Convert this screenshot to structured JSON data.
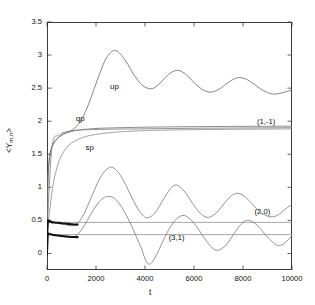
{
  "chart_data": {
    "type": "line",
    "title": "",
    "xlabel": "t",
    "ylabel": "<Y_m,n>",
    "ylabel_base": "<Y",
    "ylabel_sub": "m,n",
    "ylabel_close": ">",
    "xlim": [
      0,
      10000
    ],
    "ylim": [
      -0.25,
      3.5
    ],
    "grid": false,
    "legend": "none (inline curve annotations)",
    "xticks": [
      0,
      2000,
      4000,
      6000,
      8000,
      10000
    ],
    "xtick_labels": [
      "0",
      "2000",
      "4000",
      "6000",
      "8000",
      "10000"
    ],
    "yticks": [
      0,
      0.5,
      1,
      1.5,
      2,
      2.5,
      3,
      3.5
    ],
    "ytick_labels": [
      "0",
      "0.5",
      "1",
      "1.5",
      "2",
      "2.5",
      "3",
      "3.5"
    ],
    "annotations": [
      {
        "text": "up",
        "x": 2900,
        "y": 2.52,
        "name": "curve-label-up"
      },
      {
        "text": "qp",
        "x": 1500,
        "y": 2.03,
        "name": "curve-label-qp"
      },
      {
        "text": "sp",
        "x": 1900,
        "y": 1.6,
        "name": "curve-label-sp"
      },
      {
        "text": "(1,-1)",
        "x": 8900,
        "y": 1.99,
        "name": "state-label-1-minus1"
      },
      {
        "text": "(2,0)",
        "x": 8800,
        "y": 0.62,
        "name": "state-label-2-0"
      },
      {
        "text": "(3,1)",
        "x": 5300,
        "y": 0.23,
        "name": "state-label-3-1"
      }
    ],
    "series": [
      {
        "name": "up",
        "label": "up",
        "color": "#666666",
        "width": 0.8,
        "description": "rises from ~1.45 then large damped oscillation, max ~3.07 near t=2700, settling toward ~2.45",
        "points": [
          [
            0,
            0.3
          ],
          [
            40,
            1.1
          ],
          [
            90,
            1.4
          ],
          [
            160,
            1.56
          ],
          [
            260,
            1.66
          ],
          [
            400,
            1.73
          ],
          [
            600,
            1.79
          ],
          [
            800,
            1.83
          ],
          [
            1000,
            1.86
          ],
          [
            1200,
            1.92
          ],
          [
            1400,
            2.02
          ],
          [
            1600,
            2.17
          ],
          [
            1800,
            2.36
          ],
          [
            2000,
            2.57
          ],
          [
            2200,
            2.77
          ],
          [
            2400,
            2.94
          ],
          [
            2600,
            3.04
          ],
          [
            2750,
            3.07
          ],
          [
            2900,
            3.05
          ],
          [
            3100,
            2.97
          ],
          [
            3300,
            2.86
          ],
          [
            3500,
            2.73
          ],
          [
            3700,
            2.62
          ],
          [
            3900,
            2.54
          ],
          [
            4100,
            2.5
          ],
          [
            4250,
            2.49
          ],
          [
            4400,
            2.51
          ],
          [
            4600,
            2.57
          ],
          [
            4800,
            2.65
          ],
          [
            5000,
            2.72
          ],
          [
            5200,
            2.76
          ],
          [
            5350,
            2.77
          ],
          [
            5500,
            2.75
          ],
          [
            5700,
            2.7
          ],
          [
            5900,
            2.62
          ],
          [
            6100,
            2.55
          ],
          [
            6300,
            2.49
          ],
          [
            6500,
            2.45
          ],
          [
            6700,
            2.44
          ],
          [
            6900,
            2.46
          ],
          [
            7100,
            2.5
          ],
          [
            7300,
            2.56
          ],
          [
            7500,
            2.61
          ],
          [
            7700,
            2.65
          ],
          [
            7900,
            2.66
          ],
          [
            8100,
            2.64
          ],
          [
            8300,
            2.6
          ],
          [
            8500,
            2.55
          ],
          [
            8700,
            2.49
          ],
          [
            8900,
            2.45
          ],
          [
            9100,
            2.42
          ],
          [
            9300,
            2.41
          ],
          [
            9500,
            2.42
          ],
          [
            9700,
            2.44
          ],
          [
            9900,
            2.46
          ],
          [
            10000,
            2.47
          ]
        ]
      },
      {
        "name": "qp",
        "label": "qp",
        "color": "#6f6f6f",
        "width": 0.8,
        "description": "fast rise to plateau ~1.92, nearly flat across full range",
        "points": [
          [
            0,
            0.3
          ],
          [
            30,
            1.05
          ],
          [
            70,
            1.35
          ],
          [
            130,
            1.52
          ],
          [
            220,
            1.63
          ],
          [
            350,
            1.71
          ],
          [
            520,
            1.77
          ],
          [
            720,
            1.81
          ],
          [
            950,
            1.84
          ],
          [
            1200,
            1.86
          ],
          [
            1500,
            1.875
          ],
          [
            2000,
            1.89
          ],
          [
            2600,
            1.898
          ],
          [
            3400,
            1.905
          ],
          [
            4200,
            1.91
          ],
          [
            5200,
            1.915
          ],
          [
            6200,
            1.918
          ],
          [
            7400,
            1.921
          ],
          [
            8600,
            1.923
          ],
          [
            10000,
            1.925
          ]
        ]
      },
      {
        "name": "sp",
        "label": "sp",
        "color": "#8a8a8a",
        "width": 0.8,
        "description": "slower sigmoid rise saturating at ~1.88",
        "points": [
          [
            0,
            0.28
          ],
          [
            100,
            0.62
          ],
          [
            200,
            0.92
          ],
          [
            300,
            1.14
          ],
          [
            450,
            1.35
          ],
          [
            600,
            1.49
          ],
          [
            800,
            1.6
          ],
          [
            1000,
            1.67
          ],
          [
            1300,
            1.73
          ],
          [
            1600,
            1.77
          ],
          [
            2000,
            1.8
          ],
          [
            2500,
            1.825
          ],
          [
            3000,
            1.84
          ],
          [
            3600,
            1.852
          ],
          [
            4300,
            1.861
          ],
          [
            5200,
            1.868
          ],
          [
            6200,
            1.873
          ],
          [
            7400,
            1.877
          ],
          [
            8600,
            1.88
          ],
          [
            10000,
            1.883
          ]
        ]
      },
      {
        "name": "(1,-1)",
        "label": "(1,-1)",
        "color": "#7a7a7a",
        "width": 0.8,
        "description": "near-horizontal line just below the qp plateau, value ~1.88-1.90",
        "points": [
          [
            0,
            0.3
          ],
          [
            200,
            1.6
          ],
          [
            500,
            1.79
          ],
          [
            1000,
            1.855
          ],
          [
            2000,
            1.875
          ],
          [
            4000,
            1.885
          ],
          [
            6000,
            1.893
          ],
          [
            8000,
            1.898
          ],
          [
            10000,
            1.902
          ]
        ]
      },
      {
        "name": "(2,0)",
        "label": "(2,0)",
        "color": "#8f8f8f",
        "width": 0.8,
        "description": "flat horizontal reference line at ~0.47",
        "points": [
          [
            0,
            0.47
          ],
          [
            10000,
            0.47
          ]
        ]
      },
      {
        "name": "(3,1)",
        "label": "(3,1)",
        "color": "#8f8f8f",
        "width": 0.8,
        "description": "flat horizontal reference line at ~0.285",
        "points": [
          [
            0,
            0.285
          ],
          [
            10000,
            0.285
          ]
        ]
      },
      {
        "name": "osc-upper",
        "label": "",
        "color": "#777777",
        "width": 0.8,
        "description": "damped oscillation peaking ~1.30 at t=2600, mean drifting to ~0.55",
        "points": [
          [
            0,
            0.3
          ],
          [
            60,
            0.46
          ],
          [
            200,
            0.47
          ],
          [
            400,
            0.46
          ],
          [
            700,
            0.44
          ],
          [
            950,
            0.42
          ],
          [
            1150,
            0.43
          ],
          [
            1350,
            0.5
          ],
          [
            1550,
            0.63
          ],
          [
            1750,
            0.8
          ],
          [
            1950,
            0.97
          ],
          [
            2150,
            1.13
          ],
          [
            2350,
            1.24
          ],
          [
            2550,
            1.3
          ],
          [
            2700,
            1.295
          ],
          [
            2900,
            1.23
          ],
          [
            3100,
            1.12
          ],
          [
            3300,
            0.97
          ],
          [
            3500,
            0.82
          ],
          [
            3700,
            0.68
          ],
          [
            3900,
            0.58
          ],
          [
            4050,
            0.54
          ],
          [
            4200,
            0.55
          ],
          [
            4400,
            0.61
          ],
          [
            4600,
            0.72
          ],
          [
            4800,
            0.85
          ],
          [
            5000,
            0.96
          ],
          [
            5150,
            1.02
          ],
          [
            5300,
            1.035
          ],
          [
            5450,
            1.0
          ],
          [
            5650,
            0.92
          ],
          [
            5850,
            0.81
          ],
          [
            6050,
            0.7
          ],
          [
            6250,
            0.61
          ],
          [
            6450,
            0.555
          ],
          [
            6600,
            0.545
          ],
          [
            6800,
            0.58
          ],
          [
            7000,
            0.65
          ],
          [
            7200,
            0.74
          ],
          [
            7400,
            0.83
          ],
          [
            7600,
            0.89
          ],
          [
            7750,
            0.91
          ],
          [
            7900,
            0.9
          ],
          [
            8100,
            0.85
          ],
          [
            8300,
            0.78
          ],
          [
            8500,
            0.7
          ],
          [
            8700,
            0.63
          ],
          [
            8900,
            0.58
          ],
          [
            9100,
            0.555
          ],
          [
            9300,
            0.56
          ],
          [
            9500,
            0.6
          ],
          [
            9700,
            0.66
          ],
          [
            9900,
            0.72
          ],
          [
            10000,
            0.74
          ]
        ]
      },
      {
        "name": "osc-lower",
        "label": "",
        "color": "#777777",
        "width": 0.8,
        "description": "damped oscillation peaking ~0.86 at t=2600, dipping to ~-0.16 near t=4000",
        "points": [
          [
            0,
            0.28
          ],
          [
            60,
            0.29
          ],
          [
            250,
            0.28
          ],
          [
            500,
            0.27
          ],
          [
            750,
            0.25
          ],
          [
            950,
            0.24
          ],
          [
            1150,
            0.26
          ],
          [
            1350,
            0.33
          ],
          [
            1550,
            0.44
          ],
          [
            1750,
            0.57
          ],
          [
            1950,
            0.69
          ],
          [
            2150,
            0.79
          ],
          [
            2350,
            0.85
          ],
          [
            2500,
            0.862
          ],
          [
            2650,
            0.855
          ],
          [
            2850,
            0.8
          ],
          [
            3050,
            0.7
          ],
          [
            3250,
            0.57
          ],
          [
            3450,
            0.42
          ],
          [
            3650,
            0.25
          ],
          [
            3850,
            0.08
          ],
          [
            4000,
            -0.08
          ],
          [
            4120,
            -0.155
          ],
          [
            4250,
            -0.15
          ],
          [
            4400,
            -0.07
          ],
          [
            4600,
            0.08
          ],
          [
            4800,
            0.24
          ],
          [
            5000,
            0.38
          ],
          [
            5200,
            0.49
          ],
          [
            5400,
            0.555
          ],
          [
            5550,
            0.575
          ],
          [
            5700,
            0.56
          ],
          [
            5900,
            0.5
          ],
          [
            6100,
            0.41
          ],
          [
            6300,
            0.3
          ],
          [
            6500,
            0.19
          ],
          [
            6700,
            0.1
          ],
          [
            6850,
            0.055
          ],
          [
            7000,
            0.05
          ],
          [
            7200,
            0.09
          ],
          [
            7400,
            0.17
          ],
          [
            7600,
            0.28
          ],
          [
            7800,
            0.39
          ],
          [
            8000,
            0.47
          ],
          [
            8150,
            0.5
          ],
          [
            8300,
            0.495
          ],
          [
            8500,
            0.45
          ],
          [
            8700,
            0.38
          ],
          [
            8900,
            0.29
          ],
          [
            9100,
            0.21
          ],
          [
            9300,
            0.145
          ],
          [
            9450,
            0.12
          ],
          [
            9600,
            0.13
          ],
          [
            9800,
            0.19
          ],
          [
            10000,
            0.27
          ]
        ]
      },
      {
        "name": "transient-thick-upper",
        "label": "",
        "color": "#111111",
        "width": 2.1,
        "description": "thick dark transient, sharp rise from 0 to ~0.50 then settling on ~0.46 plateau until t~1200",
        "points": [
          [
            0,
            0.05
          ],
          [
            12,
            0.3
          ],
          [
            25,
            0.45
          ],
          [
            40,
            0.495
          ],
          [
            60,
            0.5
          ],
          [
            85,
            0.492
          ],
          [
            120,
            0.482
          ],
          [
            180,
            0.474
          ],
          [
            280,
            0.469
          ],
          [
            420,
            0.464
          ],
          [
            600,
            0.458
          ],
          [
            800,
            0.45
          ],
          [
            1000,
            0.442
          ],
          [
            1150,
            0.437
          ],
          [
            1250,
            0.437
          ]
        ]
      },
      {
        "name": "transient-thick-lower",
        "label": "",
        "color": "#111111",
        "width": 2.1,
        "description": "thick dark transient, sharp rise from 0 to ~0.30 then gentle decay to ~0.25 by t~1200",
        "points": [
          [
            0,
            0.02
          ],
          [
            12,
            0.18
          ],
          [
            25,
            0.27
          ],
          [
            40,
            0.295
          ],
          [
            60,
            0.3
          ],
          [
            90,
            0.296
          ],
          [
            140,
            0.29
          ],
          [
            220,
            0.283
          ],
          [
            340,
            0.276
          ],
          [
            500,
            0.268
          ],
          [
            700,
            0.26
          ],
          [
            900,
            0.253
          ],
          [
            1100,
            0.248
          ],
          [
            1250,
            0.247
          ]
        ]
      },
      {
        "name": "transient-spike",
        "label": "",
        "color": "#111111",
        "width": 1.6,
        "description": "near-vertical dark spike at the origin spanning 0 to ~0.50",
        "points": [
          [
            3,
            -0.02
          ],
          [
            5,
            0.5
          ]
        ]
      }
    ]
  }
}
